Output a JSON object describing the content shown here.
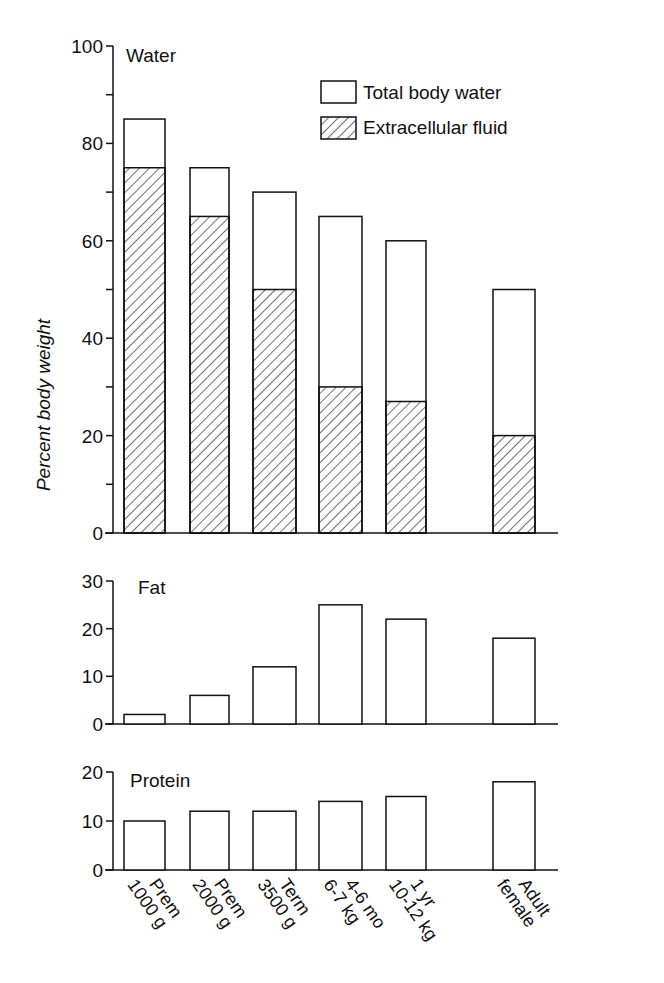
{
  "chart_data": [
    {
      "type": "bar",
      "stacked": "overlay",
      "title": "Water",
      "xlabel": "",
      "ylabel": "Percent body weight",
      "ylim": [
        0,
        100
      ],
      "yticks": [
        0,
        20,
        40,
        60,
        80,
        100
      ],
      "minor_yticks": [
        10,
        30,
        50,
        70,
        90
      ],
      "grid": false,
      "legend_position": "top-right",
      "categories": [
        "Prem 1000 g",
        "Prem 2000 g",
        "Term 3500 g",
        "4-6 mo 6-7 kg",
        "1 yr 10-12 kg",
        "Adult female"
      ],
      "series": [
        {
          "name": "Total body water",
          "pattern": "open",
          "values": [
            85,
            75,
            70,
            65,
            60,
            50
          ]
        },
        {
          "name": "Extracellular fluid",
          "pattern": "hatched",
          "values": [
            75,
            65,
            50,
            30,
            27,
            20
          ]
        }
      ]
    },
    {
      "type": "bar",
      "title": "Fat",
      "ylabel": "Percent body weight",
      "ylim": [
        0,
        30
      ],
      "yticks": [
        0,
        10,
        20,
        30
      ],
      "grid": false,
      "categories": [
        "Prem 1000 g",
        "Prem 2000 g",
        "Term 3500 g",
        "4-6 mo 6-7 kg",
        "1 yr 10-12 kg",
        "Adult female"
      ],
      "values": [
        2,
        6,
        12,
        25,
        22,
        18
      ]
    },
    {
      "type": "bar",
      "title": "Protein",
      "ylabel": "Percent body weight",
      "ylim": [
        0,
        20
      ],
      "yticks": [
        0,
        10,
        20
      ],
      "grid": false,
      "categories": [
        "Prem 1000 g",
        "Prem 2000 g",
        "Term 3500 g",
        "4-6 mo 6-7 kg",
        "1 yr 10-12 kg",
        "Adult female"
      ],
      "values": [
        10,
        12,
        12,
        14,
        15,
        18
      ]
    }
  ],
  "labels": {
    "ylabel": "Percent body weight",
    "water_title": "Water",
    "fat_title": "Fat",
    "protein_title": "Protein",
    "legend_total": "Total body water",
    "legend_ecf": "Extracellular fluid",
    "categories": [
      {
        "line1": "Prem",
        "line2": "1000 g"
      },
      {
        "line1": "Prem",
        "line2": "2000 g"
      },
      {
        "line1": "Term",
        "line2": "3500 g"
      },
      {
        "line1": "4-6 mo",
        "line2": "6-7 kg"
      },
      {
        "line1": "1 yr",
        "line2": "10-12 kg"
      },
      {
        "line1": "Adult",
        "line2": "female"
      }
    ]
  },
  "colors": {
    "ink": "#111111",
    "background": "#ffffff"
  }
}
